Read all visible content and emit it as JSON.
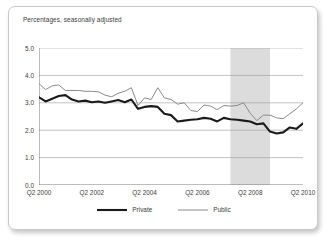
{
  "chart_data": {
    "type": "line",
    "title": "",
    "subtitle": "Percentages, seasonally adjusted",
    "xlabel": "",
    "ylabel": "",
    "ylim": [
      0.0,
      5.0
    ],
    "yticks": [
      "0.0",
      "1.0",
      "2.0",
      "3.0",
      "4.0",
      "5.0"
    ],
    "ytick_values": [
      0.0,
      1.0,
      2.0,
      3.0,
      4.0,
      5.0
    ],
    "xticks": [
      "Q2 2000",
      "Q2 2002",
      "Q2 2004",
      "Q2 2006",
      "Q2 2008",
      "Q2 2010"
    ],
    "xtick_values": [
      0,
      8,
      16,
      24,
      32,
      40
    ],
    "grid": true,
    "legend_position": "bottom",
    "x": [
      0,
      1,
      2,
      3,
      4,
      5,
      6,
      7,
      8,
      9,
      10,
      11,
      12,
      13,
      14,
      15,
      16,
      17,
      18,
      19,
      20,
      21,
      22,
      23,
      24,
      25,
      26,
      27,
      28,
      29,
      30,
      31,
      32,
      33,
      34,
      35,
      36,
      37,
      38,
      39,
      40
    ],
    "x_quarter_labels": [
      "Q2 2000",
      "Q3 2000",
      "Q4 2000",
      "Q1 2001",
      "Q2 2001",
      "Q3 2001",
      "Q4 2001",
      "Q1 2002",
      "Q2 2002",
      "Q3 2002",
      "Q4 2002",
      "Q1 2003",
      "Q2 2003",
      "Q3 2003",
      "Q4 2003",
      "Q1 2004",
      "Q2 2004",
      "Q3 2004",
      "Q4 2004",
      "Q1 2005",
      "Q2 2005",
      "Q3 2005",
      "Q4 2005",
      "Q1 2006",
      "Q2 2006",
      "Q3 2006",
      "Q4 2006",
      "Q1 2007",
      "Q2 2007",
      "Q3 2007",
      "Q4 2007",
      "Q1 2008",
      "Q2 2008",
      "Q3 2008",
      "Q4 2008",
      "Q1 2009",
      "Q2 2009",
      "Q3 2009",
      "Q4 2009",
      "Q1 2010",
      "Q2 2010"
    ],
    "series": [
      {
        "name": "Private",
        "color": "#1a1a1a",
        "line_width": 2.1,
        "values": [
          3.2,
          3.05,
          3.15,
          3.25,
          3.28,
          3.12,
          3.05,
          3.08,
          3.02,
          3.05,
          3.0,
          3.05,
          3.1,
          3.02,
          3.12,
          2.78,
          2.85,
          2.88,
          2.85,
          2.6,
          2.55,
          2.32,
          2.35,
          2.38,
          2.4,
          2.45,
          2.42,
          2.32,
          2.45,
          2.4,
          2.38,
          2.35,
          2.32,
          2.22,
          2.25,
          1.95,
          1.88,
          1.92,
          2.1,
          2.05,
          2.25
        ]
      },
      {
        "name": "Public",
        "color": "#8a8a8a",
        "line_width": 1.0,
        "values": [
          3.7,
          3.48,
          3.62,
          3.65,
          3.45,
          3.45,
          3.45,
          3.42,
          3.42,
          3.4,
          3.28,
          3.22,
          3.35,
          3.42,
          3.55,
          2.9,
          3.18,
          3.12,
          3.55,
          3.18,
          3.12,
          2.95,
          3.0,
          2.72,
          2.68,
          2.92,
          2.88,
          2.75,
          2.9,
          2.88,
          2.9,
          3.0,
          2.62,
          2.35,
          2.55,
          2.55,
          2.45,
          2.42,
          2.6,
          2.78,
          3.0
        ]
      }
    ],
    "shaded_regions": [
      {
        "name": "recession-band",
        "x_start": 29,
        "x_end": 35,
        "color": "#dcdcdc",
        "label": ""
      }
    ],
    "legend": [
      {
        "label": "Private",
        "color": "#1a1a1a",
        "width": 2.1
      },
      {
        "label": "Public",
        "color": "#8a8a8a",
        "width": 1.0
      }
    ]
  }
}
